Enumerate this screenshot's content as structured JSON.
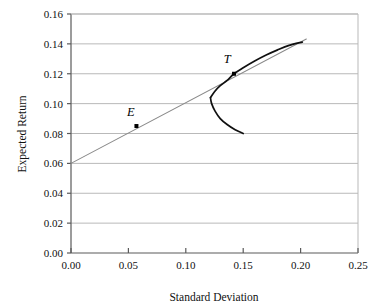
{
  "chart_data": {
    "type": "line",
    "title": "",
    "xlabel": "Standard Deviation",
    "ylabel": "Expected Return",
    "xlim": [
      0.0,
      0.25
    ],
    "ylim": [
      0.0,
      0.16
    ],
    "xticks": [
      "0.00",
      "0.05",
      "0.10",
      "0.15",
      "0.20",
      "0.25"
    ],
    "xtick_values": [
      0.0,
      0.05,
      0.1,
      0.15,
      0.2,
      0.25
    ],
    "yticks": [
      "0.00",
      "0.02",
      "0.04",
      "0.06",
      "0.08",
      "0.10",
      "0.12",
      "0.14",
      "0.16"
    ],
    "ytick_values": [
      0.0,
      0.02,
      0.04,
      0.06,
      0.08,
      0.1,
      0.12,
      0.14,
      0.16
    ],
    "grid": "horizontal",
    "legend": "none",
    "series": [
      {
        "name": "capital-market-line",
        "type": "line",
        "color": "#8a8a8a",
        "x": [
          0.0,
          0.205
        ],
        "y": [
          0.06,
          0.1432
        ],
        "intercept": 0.06,
        "slope": 0.4059
      },
      {
        "name": "efficient-frontier-upper",
        "type": "curve",
        "color": "#101010",
        "x": [
          0.1215,
          0.125,
          0.13,
          0.136,
          0.142,
          0.15,
          0.16,
          0.17,
          0.18,
          0.19,
          0.2015
        ],
        "y": [
          0.104,
          0.108,
          0.112,
          0.1155,
          0.12,
          0.124,
          0.1285,
          0.1325,
          0.136,
          0.139,
          0.1412
        ]
      },
      {
        "name": "frontier-lower-branch",
        "type": "curve",
        "color": "#101010",
        "x": [
          0.1215,
          0.1225,
          0.1255,
          0.13,
          0.136,
          0.143,
          0.15
        ],
        "y": [
          0.104,
          0.1,
          0.095,
          0.09,
          0.086,
          0.0825,
          0.08
        ]
      }
    ],
    "points": [
      {
        "label": "E",
        "x": 0.057,
        "y": 0.085,
        "marker": "square",
        "color": "#000000"
      },
      {
        "label": "T",
        "x": 0.142,
        "y": 0.12,
        "marker": "square",
        "color": "#000000"
      }
    ],
    "annotations": [
      {
        "text": "E",
        "x": 0.052,
        "y": 0.0915,
        "style": "italic-serif"
      },
      {
        "text": "T",
        "x": 0.136,
        "y": 0.1275,
        "style": "italic-serif"
      }
    ],
    "colors": {
      "grid": "#b9b9b9",
      "axis": "#5a5a5a",
      "line": "#8a8a8a",
      "curve": "#101010",
      "background": "#ffffff",
      "text": "#111111"
    }
  }
}
